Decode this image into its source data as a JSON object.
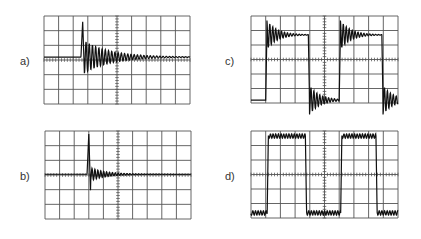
{
  "figure": {
    "panels": [
      {
        "id": "a",
        "label": "a)",
        "label_pos": [
          20,
          55
        ],
        "grid": {
          "x": 44,
          "y": 16,
          "w": 146,
          "h": 88,
          "cols": 10,
          "rows": 6
        },
        "description": "Single transient spike with damped ringing settling to baseline slightly above center",
        "trace_type": "spike_ringing",
        "params": {
          "baseline": 3.2,
          "spike_at": 2.65,
          "spike_peak": 5.6,
          "ring_amp": 1.1,
          "ring_decay": 0.55,
          "ring_period": 0.22
        }
      },
      {
        "id": "b",
        "label": "b)",
        "label_pos": [
          20,
          170
        ],
        "grid": {
          "x": 45,
          "y": 131,
          "w": 146,
          "h": 88,
          "cols": 10,
          "rows": 6
        },
        "description": "Narrow spike with small symmetric ringing about center baseline",
        "trace_type": "spike_small",
        "params": {
          "baseline": 3.05,
          "spike_at": 3.0,
          "spike_peak": 5.8,
          "ring_amp": 0.45,
          "ring_decay": 0.9,
          "ring_period": 0.2
        }
      },
      {
        "id": "c",
        "label": "c)",
        "label_pos": [
          225,
          55
        ],
        "grid": {
          "x": 251,
          "y": 16,
          "w": 147,
          "h": 87,
          "cols": 10,
          "rows": 6
        },
        "description": "Square wave with large overshoot and ringing on each edge",
        "trace_type": "square_ringing",
        "params": {
          "high": 4.7,
          "low": 0.2,
          "edges": [
            1.0,
            3.9,
            6.0,
            8.9
          ],
          "ring_amp": 1.0,
          "ring_decay": 1.4,
          "ring_period": 0.2
        }
      },
      {
        "id": "d",
        "label": "d)",
        "label_pos": [
          225,
          170
        ],
        "grid": {
          "x": 251,
          "y": 131,
          "w": 147,
          "h": 87,
          "cols": 10,
          "rows": 6
        },
        "description": "Square wave with small flat-top ripple, nearly clean edges",
        "trace_type": "square_ripple",
        "params": {
          "high": 5.65,
          "low": 0.35,
          "edges": [
            1.1,
            3.7,
            6.1,
            8.5
          ],
          "ring_amp": 0.3,
          "ring_decay": 0.4,
          "ring_period": 0.18
        }
      }
    ],
    "colors": {
      "grid": "#555555",
      "trace": "#111111",
      "label": "#333333"
    }
  }
}
